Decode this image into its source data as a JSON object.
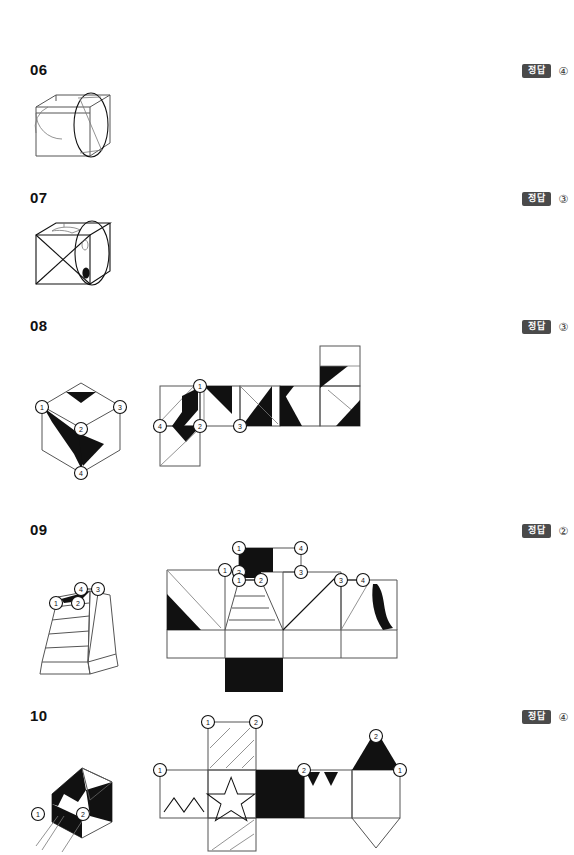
{
  "page": {
    "answer_tag_label": "정답",
    "badge_color": "#4a4a4a"
  },
  "problems": [
    {
      "number": "06",
      "answer": "④",
      "figure_type": "cube-with-circle",
      "description": "Cube in oblique projection with a large ellipse overlapping its right face and an arc on the front-left face",
      "vertex_labels": []
    },
    {
      "number": "07",
      "answer": "③",
      "figure_type": "cube-with-circle-and-diagonals",
      "description": "Cube with X diagonals on the front face, an ellipse overlapping the right side, a small oval and a filled oval",
      "vertex_labels": []
    },
    {
      "number": "08",
      "answer": "③",
      "figure_type": "cube-isometric-with-net",
      "description": "Isometric cube with black arrow shapes and numbered vertices, shown with its unfolded net",
      "vertex_labels": [
        "①",
        "②",
        "③",
        "④"
      ],
      "net_labels": [
        "①",
        "②",
        "③",
        "④"
      ]
    },
    {
      "number": "09",
      "answer": "②",
      "figure_type": "frustum-with-net",
      "description": "Truncated pyramid with horizontal stripes and a black patch, shown with its unfolded net",
      "vertex_labels": [
        "①",
        "②",
        "③",
        "④"
      ],
      "net_labels": [
        "①",
        "②",
        "③",
        "④"
      ]
    },
    {
      "number": "10",
      "answer": "④",
      "figure_type": "house-solid-with-net",
      "description": "House-shaped solid with black triangular faces, shown with its unfolded net containing a star, zigzag, black square and triangles",
      "vertex_labels": [
        "①",
        "②"
      ],
      "net_labels": [
        "①",
        "②"
      ]
    }
  ]
}
